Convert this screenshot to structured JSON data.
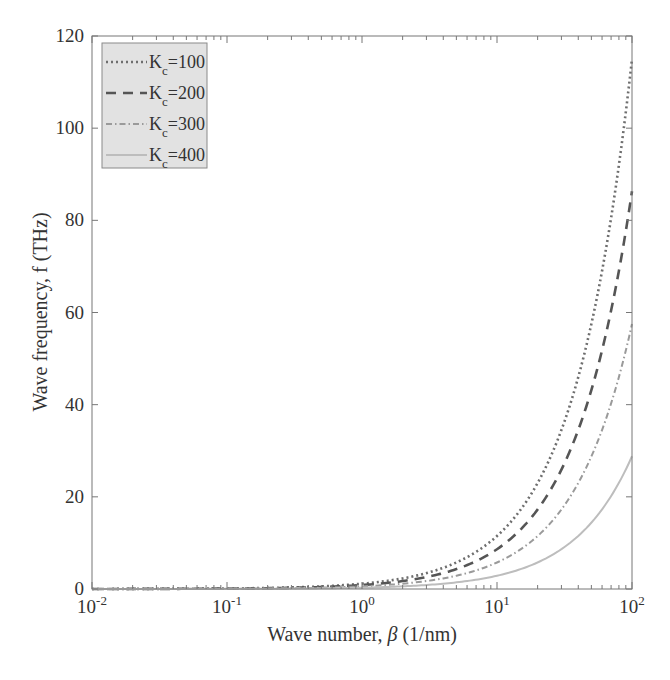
{
  "chart_data": {
    "type": "line",
    "title": "",
    "xlabel": "Wave number, β (1/nm)",
    "xlabel_parts": {
      "prefix": "Wave number, ",
      "symbol": "β",
      "suffix": " (1/nm)"
    },
    "ylabel": "Wave frequency, f (THz)",
    "xscale": "log",
    "xlim": [
      0.01,
      100
    ],
    "ylim": [
      0,
      120
    ],
    "x_ticks": [
      {
        "base": "10",
        "exp": "-2",
        "value": 0.01
      },
      {
        "base": "10",
        "exp": "-1",
        "value": 0.1
      },
      {
        "base": "10",
        "exp": "0",
        "value": 1
      },
      {
        "base": "10",
        "exp": "1",
        "value": 10
      },
      {
        "base": "10",
        "exp": "2",
        "value": 100
      }
    ],
    "y_ticks": [
      0,
      20,
      40,
      60,
      80,
      100,
      120
    ],
    "grid": false,
    "legend_position": "upper left",
    "series": [
      {
        "name": "K_c=100",
        "label_base": "K",
        "label_sub": "c",
        "label_value": "=100",
        "style": "dotted",
        "color": "#6e6e6e",
        "x": [
          0.01,
          0.1,
          1,
          2,
          5,
          10,
          20,
          50,
          100
        ],
        "y": [
          0.0115,
          0.115,
          1.15,
          2.3,
          5.75,
          11.5,
          23,
          57.5,
          115
        ]
      },
      {
        "name": "K_c=200",
        "label_base": "K",
        "label_sub": "c",
        "label_value": "=200",
        "style": "dashed",
        "color": "#555555",
        "x": [
          0.01,
          0.1,
          1,
          2,
          5,
          10,
          20,
          50,
          100
        ],
        "y": [
          0.0086,
          0.086,
          0.86,
          1.73,
          4.31,
          8.6,
          17.3,
          43.1,
          86.3
        ]
      },
      {
        "name": "K_c=300",
        "label_base": "K",
        "label_sub": "c",
        "label_value": "=300",
        "style": "dash-dot",
        "color": "#9a9a9a",
        "x": [
          0.01,
          0.1,
          1,
          2,
          5,
          10,
          20,
          50,
          100
        ],
        "y": [
          0.0058,
          0.058,
          0.58,
          1.15,
          2.88,
          5.75,
          11.5,
          28.8,
          57.5
        ]
      },
      {
        "name": "K_c=400",
        "label_base": "K",
        "label_sub": "c",
        "label_value": "=400",
        "style": "solid",
        "color": "#bdbdbd",
        "x": [
          0.01,
          0.1,
          1,
          2,
          5,
          10,
          20,
          50,
          100
        ],
        "y": [
          0.0029,
          0.029,
          0.29,
          0.58,
          1.44,
          2.9,
          5.75,
          14.4,
          28.8
        ]
      }
    ]
  },
  "colors": {
    "axis": "#555555",
    "legend_bg": "#e2e2e2",
    "legend_border": "#8a8a8a",
    "text": "#333333"
  }
}
